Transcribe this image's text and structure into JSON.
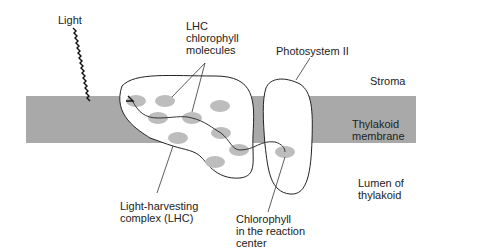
{
  "labels": {
    "light": "Light",
    "lhc_chlorophyll": "LHC\nchlorophyll\nmolecules",
    "photosystem": "Photosystem II",
    "stroma": "Stroma",
    "thylakoid_membrane": "Thylakoid\nmembrane",
    "lumen": "Lumen of\nthylakoid",
    "lhc_complex": "Light-harvesting\ncomplex (LHC)",
    "reaction_center": "Chlorophyll\nin the reaction\ncenter"
  },
  "colors": {
    "membrane": "#a9a9a9",
    "chlorophyll": "#bdbdbd",
    "outline": "#222222"
  }
}
